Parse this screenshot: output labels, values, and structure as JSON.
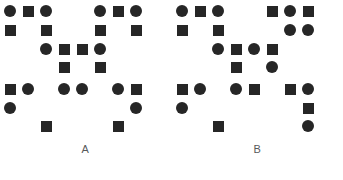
{
  "figure": {
    "type": "shape-pattern-comparison",
    "background_color": "#ffffff",
    "shape_color": "#262626",
    "label_color": "#58595b",
    "grid": {
      "columns_x": [
        10,
        28,
        46,
        64,
        82,
        100,
        118,
        136
      ],
      "rows_y": [
        11,
        30,
        49,
        67,
        89,
        108,
        126
      ],
      "cell_pitch_x": 18,
      "square_size": 11,
      "circle_size": 12
    },
    "panels": [
      {
        "id": "A",
        "label": "A",
        "shape_count": 22,
        "shapes": [
          {
            "col": 0,
            "row": 0,
            "shape": "circle"
          },
          {
            "col": 1,
            "row": 0,
            "shape": "square"
          },
          {
            "col": 2,
            "row": 0,
            "shape": "circle"
          },
          {
            "col": 5,
            "row": 0,
            "shape": "circle"
          },
          {
            "col": 6,
            "row": 0,
            "shape": "square"
          },
          {
            "col": 7,
            "row": 0,
            "shape": "circle"
          },
          {
            "col": 0,
            "row": 1,
            "shape": "square"
          },
          {
            "col": 2,
            "row": 1,
            "shape": "square"
          },
          {
            "col": 5,
            "row": 1,
            "shape": "square"
          },
          {
            "col": 7,
            "row": 1,
            "shape": "square"
          },
          {
            "col": 2,
            "row": 2,
            "shape": "circle"
          },
          {
            "col": 3,
            "row": 2,
            "shape": "square"
          },
          {
            "col": 4,
            "row": 2,
            "shape": "square"
          },
          {
            "col": 5,
            "row": 2,
            "shape": "circle"
          },
          {
            "col": 3,
            "row": 3,
            "shape": "square"
          },
          {
            "col": 5,
            "row": 3,
            "shape": "square"
          },
          {
            "col": 0,
            "row": 4,
            "shape": "square"
          },
          {
            "col": 1,
            "row": 4,
            "shape": "circle"
          },
          {
            "col": 3,
            "row": 4,
            "shape": "circle"
          },
          {
            "col": 4,
            "row": 4,
            "shape": "circle"
          },
          {
            "col": 6,
            "row": 4,
            "shape": "circle"
          },
          {
            "col": 7,
            "row": 4,
            "shape": "square"
          },
          {
            "col": 0,
            "row": 5,
            "shape": "circle"
          },
          {
            "col": 7,
            "row": 5,
            "shape": "circle"
          },
          {
            "col": 2,
            "row": 6,
            "shape": "square"
          },
          {
            "col": 6,
            "row": 6,
            "shape": "square"
          }
        ]
      },
      {
        "id": "B",
        "label": "B",
        "shape_count": 22,
        "shapes": [
          {
            "col": 0,
            "row": 0,
            "shape": "circle"
          },
          {
            "col": 1,
            "row": 0,
            "shape": "square"
          },
          {
            "col": 2,
            "row": 0,
            "shape": "circle"
          },
          {
            "col": 5,
            "row": 0,
            "shape": "square"
          },
          {
            "col": 6,
            "row": 0,
            "shape": "circle"
          },
          {
            "col": 7,
            "row": 0,
            "shape": "square"
          },
          {
            "col": 0,
            "row": 1,
            "shape": "square"
          },
          {
            "col": 2,
            "row": 1,
            "shape": "square"
          },
          {
            "col": 6,
            "row": 1,
            "shape": "circle"
          },
          {
            "col": 7,
            "row": 1,
            "shape": "circle"
          },
          {
            "col": 2,
            "row": 2,
            "shape": "circle"
          },
          {
            "col": 3,
            "row": 2,
            "shape": "square"
          },
          {
            "col": 4,
            "row": 2,
            "shape": "circle"
          },
          {
            "col": 5,
            "row": 2,
            "shape": "square"
          },
          {
            "col": 3,
            "row": 3,
            "shape": "square"
          },
          {
            "col": 5,
            "row": 3,
            "shape": "circle"
          },
          {
            "col": 0,
            "row": 4,
            "shape": "square"
          },
          {
            "col": 1,
            "row": 4,
            "shape": "circle"
          },
          {
            "col": 3,
            "row": 4,
            "shape": "circle"
          },
          {
            "col": 4,
            "row": 4,
            "shape": "square"
          },
          {
            "col": 6,
            "row": 4,
            "shape": "square"
          },
          {
            "col": 7,
            "row": 4,
            "shape": "circle"
          },
          {
            "col": 0,
            "row": 5,
            "shape": "circle"
          },
          {
            "col": 7,
            "row": 5,
            "shape": "square"
          },
          {
            "col": 2,
            "row": 6,
            "shape": "square"
          },
          {
            "col": 7,
            "row": 6,
            "shape": "circle"
          }
        ]
      }
    ]
  }
}
